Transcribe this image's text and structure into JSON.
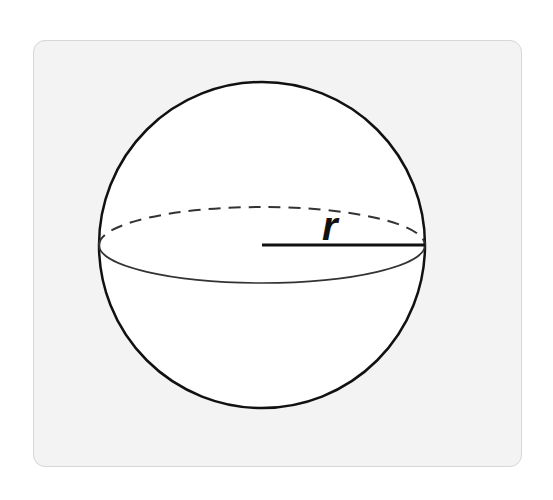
{
  "diagram": {
    "radius_label": "r",
    "shape": "sphere",
    "colors": {
      "card_background": "#f3f3f3",
      "card_border": "#d6d6d6",
      "sphere_fill": "#ffffff",
      "stroke": "#111111"
    }
  }
}
